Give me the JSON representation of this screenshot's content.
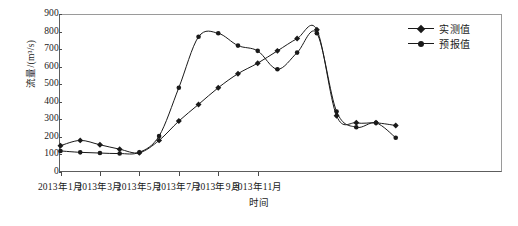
{
  "chart_data": {
    "type": "line",
    "title": "",
    "xlabel": "时间",
    "ylabel": "流量/(m³/s)",
    "ylim": [
      0,
      900
    ],
    "y_ticks": [
      0,
      100,
      200,
      300,
      400,
      500,
      600,
      700,
      800,
      900
    ],
    "grid": false,
    "legend_position": "top-right",
    "x": [
      "2013年1月",
      "2013年2月",
      "2013年3月",
      "2013年4月",
      "2013年5月",
      "2013年6月",
      "2013年7月",
      "2013年8月",
      "2013年9月",
      "2013年10月",
      "2013年11月",
      "2013年12月",
      "2014年1月",
      "2014年2月",
      "2014年3月",
      "2014年4月",
      "2014年5月",
      "2014年6月"
    ],
    "x_tick_labels": [
      "2013年1月",
      "2013年3月",
      "2013年5月",
      "2013年7月",
      "2013年9月",
      "2013年11月"
    ],
    "x_tick_indices": [
      0,
      2,
      4,
      6,
      8,
      10
    ],
    "categories": [
      "2013年1月",
      "2013年2月",
      "2013年3月",
      "2013年4月",
      "2013年5月",
      "2013年6月",
      "2013年7月",
      "2013年8月",
      "2013年9月",
      "2013年10月",
      "2013年11月",
      "2013年12月",
      "2014年1月",
      "2014年2月",
      "2014年3月",
      "2014年4月",
      "2014年5月",
      "2014年6月"
    ],
    "series": [
      {
        "name": "实测值",
        "marker": "diamond",
        "color": "#1a1a1a",
        "values": [
          150,
          180,
          155,
          130,
          110,
          180,
          290,
          385,
          480,
          560,
          620,
          690,
          760,
          810,
          320,
          280,
          280,
          265
        ]
      },
      {
        "name": "预报值",
        "marker": "circle",
        "color": "#1a1a1a",
        "values": [
          120,
          112,
          108,
          105,
          112,
          205,
          480,
          770,
          790,
          720,
          690,
          585,
          680,
          790,
          345,
          255,
          280,
          195
        ]
      }
    ]
  },
  "legend": {
    "items": [
      {
        "label": "实测值",
        "marker": "diamond"
      },
      {
        "label": "预报值",
        "marker": "circle"
      }
    ]
  }
}
